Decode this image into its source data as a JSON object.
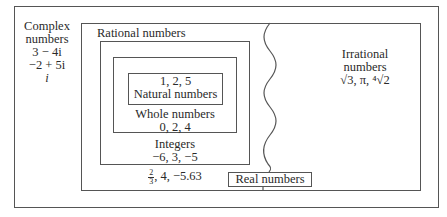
{
  "diagram": {
    "complex": {
      "label_line1": "Complex",
      "label_line2": "numbers",
      "examples": [
        "3 − 4i",
        "−2 + 5i",
        "i"
      ]
    },
    "real": {
      "label": "Real numbers"
    },
    "rational": {
      "label": "Rational numbers",
      "examples_frac_num": "2",
      "examples_frac_den": "3",
      "examples_rest": ", 4, −5.63"
    },
    "integers": {
      "label": "Integers",
      "examples": "−6, 3, −5"
    },
    "whole": {
      "label": "Whole numbers",
      "examples": "0, 2, 4"
    },
    "natural": {
      "examples": "1, 2, 5",
      "label": "Natural numbers"
    },
    "irrational": {
      "label_line1": "Irrational",
      "label_line2": "numbers",
      "examples": "√3, π, ⁴√2"
    }
  }
}
